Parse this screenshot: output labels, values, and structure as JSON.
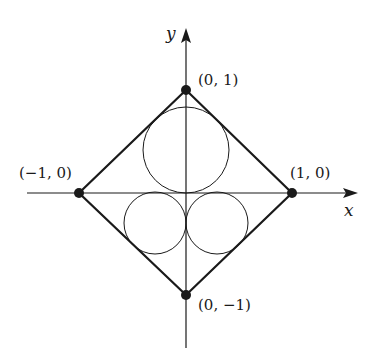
{
  "diagram": {
    "axes": {
      "x_label": "x",
      "y_label": "y"
    },
    "vertices": [
      {
        "id": "top",
        "label": "(0, 1)",
        "x": 0,
        "y": 1
      },
      {
        "id": "right",
        "label": "(1, 0)",
        "x": 1,
        "y": 0
      },
      {
        "id": "bottom",
        "label": "(0, −1)",
        "x": 0,
        "y": -1
      },
      {
        "id": "left",
        "label": "(−1, 0)",
        "x": -1,
        "y": 0
      }
    ],
    "shape": "square rotated 45° (diamond) with vertices at (±1,0), (0,±1)",
    "circles": [
      {
        "id": "upper",
        "description": "circle in upper half, tangent to x-axis and both upper edges"
      },
      {
        "id": "lower-left",
        "description": "circle in lower-left, tangent to x-axis, y-axis and lower-left edge"
      },
      {
        "id": "lower-right",
        "description": "circle in lower-right, tangent to x-axis, y-axis and lower-right edge"
      }
    ],
    "colors": {
      "ink": "#1a1a1a",
      "background": "#ffffff"
    }
  }
}
